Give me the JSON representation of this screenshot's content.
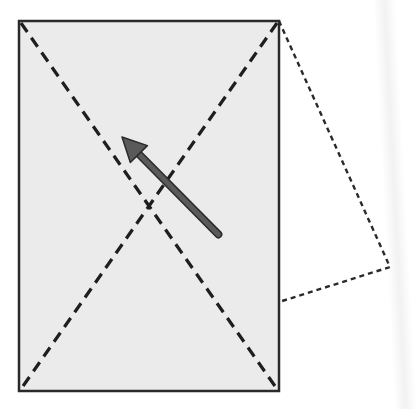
{
  "diagram": {
    "type": "paper-fold-illustration",
    "colors": {
      "background": "#ffffff",
      "sheet_fill": "#ebebeb",
      "sheet_border": "#2a2a2a",
      "fold_line": "#1e1e1e",
      "flap_line": "#2a2a2a",
      "arrow_fill": "#5a5a5a",
      "arrow_stroke": "#2a2a2a"
    },
    "sheet": {
      "x": 19,
      "y": 21,
      "width": 260,
      "height": 370
    },
    "fold_lines": [
      {
        "name": "diagonal-top-left-to-bottom-right",
        "x1": 21,
        "y1": 23,
        "x2": 277,
        "y2": 389,
        "style": "dashed"
      },
      {
        "name": "diagonal-top-right-to-bottom-left",
        "x1": 277,
        "y1": 23,
        "x2": 21,
        "y2": 389,
        "style": "dashed"
      }
    ],
    "flap": {
      "style": "dotted",
      "points": [
        [
          279,
          21
        ],
        [
          390,
          267
        ],
        [
          279,
          302
        ]
      ]
    },
    "arrow": {
      "from": [
        217,
        233
      ],
      "to": [
        122,
        137
      ],
      "direction": "up-left"
    }
  }
}
